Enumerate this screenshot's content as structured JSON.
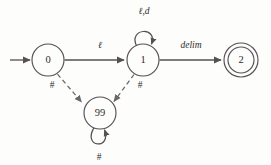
{
  "diagram": {
    "type": "state-transition-diagram",
    "background_color": "#fdfdfc",
    "stroke_color": "#555053",
    "dashed_stroke_color": "#6c6669",
    "text_color": "#2e2b2c",
    "states": [
      {
        "id": "s0",
        "label": "0",
        "kind": "start",
        "accepting": false,
        "cx": 48,
        "cy": 60,
        "r": 16
      },
      {
        "id": "s1",
        "label": "1",
        "kind": "normal",
        "accepting": false,
        "cx": 143,
        "cy": 60,
        "r": 16
      },
      {
        "id": "s2",
        "label": "2",
        "kind": "accepting",
        "accepting": true,
        "cx": 241,
        "cy": 60,
        "r": 17,
        "r_inner": 13
      },
      {
        "id": "s99",
        "label": "99",
        "kind": "error",
        "accepting": false,
        "cx": 100,
        "cy": 113,
        "r": 16
      }
    ],
    "transitions": [
      {
        "id": "t-start",
        "from": null,
        "to": "s0",
        "label": "",
        "style": "solid",
        "kind": "start-arrow"
      },
      {
        "id": "t-0-1",
        "from": "s0",
        "to": "s1",
        "label": "ℓ",
        "style": "solid",
        "italic": true
      },
      {
        "id": "t-1-1",
        "from": "s1",
        "to": "s1",
        "label": "ℓ,d",
        "style": "solid",
        "kind": "self-loop",
        "italic": true
      },
      {
        "id": "t-1-2",
        "from": "s1",
        "to": "s2",
        "label": "delim",
        "style": "solid",
        "italic": true
      },
      {
        "id": "t-0-99",
        "from": "s0",
        "to": "s99",
        "label": "#",
        "style": "dashed",
        "italic": false
      },
      {
        "id": "t-1-99",
        "from": "s1",
        "to": "s99",
        "label": "#",
        "style": "dashed",
        "italic": false
      },
      {
        "id": "t-99-99",
        "from": "s99",
        "to": "s99",
        "label": "#",
        "style": "solid",
        "kind": "self-loop",
        "italic": false
      }
    ],
    "labels": {
      "state_0": "0",
      "state_1": "1",
      "state_2": "2",
      "state_99": "99",
      "edge_0_to_1": "ℓ",
      "edge_1_self": "ℓ,d",
      "edge_1_to_2": "delim",
      "edge_0_to_99": "#",
      "edge_1_to_99": "#",
      "edge_99_self": "#"
    }
  }
}
